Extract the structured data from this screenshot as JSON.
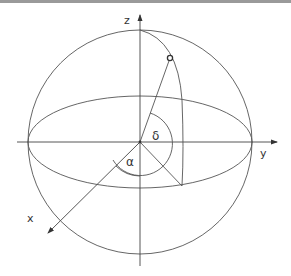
{
  "diagram": {
    "type": "celestial-sphere",
    "axes": {
      "x_label": "x",
      "y_label": "y",
      "z_label": "z"
    },
    "angles": {
      "alpha_label": "α",
      "delta_label": "δ"
    },
    "colors": {
      "line": "#555555",
      "axis": "#444444",
      "border": "#9a9a9a",
      "text": "#333333"
    }
  }
}
